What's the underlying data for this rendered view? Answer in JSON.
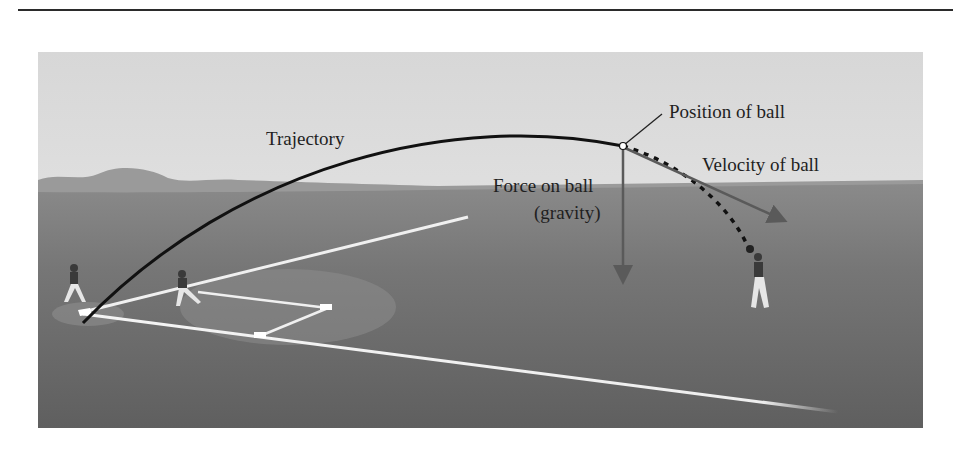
{
  "figure": {
    "labels": {
      "trajectory": "Trajectory",
      "position": "Position of ball",
      "velocity": "Velocity of ball",
      "force_line1": "Force on ball",
      "force_line2": "(gravity)"
    },
    "colors": {
      "sky": "#e4e4e4",
      "grass": "#6d6d6d",
      "trajectory": "#111111",
      "arrows": "#5a5a5a",
      "chalk": "#f2f2f2"
    }
  }
}
